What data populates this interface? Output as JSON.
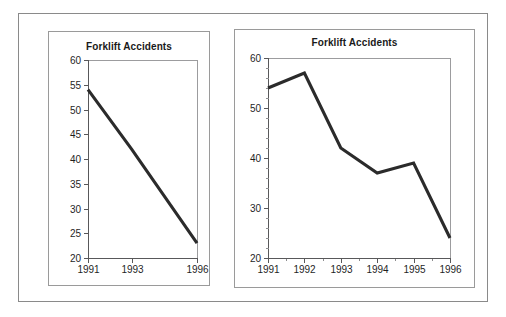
{
  "figure": {
    "title": "Forklift Accidents",
    "panel_count": 2,
    "frame_color": "#8a8a8a",
    "background_color": "#ffffff",
    "line_color": "#2b2b2b",
    "axis_color": "#58585a"
  },
  "chart_data": [
    {
      "type": "line",
      "panel": "left",
      "title": "Forklift Accidents",
      "xlabel": "",
      "ylabel": "",
      "categories": [
        "1991",
        "1993",
        "1996"
      ],
      "x": [
        1991,
        1993,
        1996
      ],
      "values": [
        54,
        42,
        23
      ],
      "series": [
        {
          "name": "Forklift Accidents",
          "values": [
            54,
            42,
            23
          ]
        }
      ],
      "xlim": [
        1991,
        1996
      ],
      "ylim": [
        20,
        60
      ],
      "ytick_labels": [
        "60",
        "55",
        "50",
        "45",
        "40",
        "35",
        "30",
        "25",
        "20"
      ],
      "yticks": [
        60,
        55,
        50,
        45,
        40,
        35,
        30,
        25,
        20
      ],
      "ytick_step": 5,
      "xtick_labels": [
        "1991",
        "1993",
        "1996"
      ],
      "grid": false,
      "legend": false,
      "note": "x-axis uses uneven year spacing (1991, 1993, 1996)"
    },
    {
      "type": "line",
      "panel": "right",
      "title": "Forklift Accidents",
      "xlabel": "",
      "ylabel": "",
      "categories": [
        "1991",
        "1992",
        "1993",
        "1994",
        "1995",
        "1996"
      ],
      "x": [
        1991,
        1992,
        1993,
        1994,
        1995,
        1996
      ],
      "values": [
        54,
        57,
        42,
        37,
        39,
        24
      ],
      "series": [
        {
          "name": "Forklift Accidents",
          "values": [
            54,
            57,
            42,
            37,
            39,
            24
          ]
        }
      ],
      "xlim": [
        1991,
        1996
      ],
      "ylim": [
        20,
        60
      ],
      "ytick_labels": [
        "60",
        "50",
        "40",
        "30",
        "20"
      ],
      "yticks": [
        60,
        50,
        40,
        30,
        20
      ],
      "ytick_step": 10,
      "yminor_step": 2,
      "xtick_labels": [
        "1991",
        "1992",
        "1993",
        "1994",
        "1995",
        "1996"
      ],
      "grid": false,
      "legend": false,
      "note": "x-axis uses evenly spaced consecutive years"
    }
  ]
}
